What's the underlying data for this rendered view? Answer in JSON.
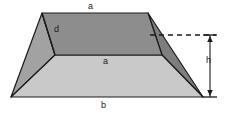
{
  "figure": {
    "width": 227,
    "height": 115,
    "background": "#ffffff",
    "stroke_color": "#1a1a1a",
    "stroke_width": 1.2,
    "faces": {
      "top": {
        "name": "top-face",
        "fill": "#8d8d8d",
        "points": "42,13 148,13 162,55 55,55"
      },
      "front": {
        "name": "front-face",
        "fill": "#c9c9c9",
        "points": "55,55 162,55 203,97 11,97"
      },
      "left": {
        "name": "left-face",
        "fill": "#a2a2a2",
        "points": "42,13 55,55 11,97"
      },
      "right": {
        "name": "right-face",
        "fill": "#7e7e7e",
        "points": "148,13 162,55 203,97"
      }
    },
    "dimension": {
      "dashed_line": {
        "x1": 150,
        "y1": 35,
        "x2": 216,
        "y2": 35,
        "dash": "5 4"
      },
      "height_line": {
        "x": 210,
        "y1": 35,
        "y2": 97
      },
      "tick_top": {
        "x1": 203,
        "y1": 35,
        "x2": 217,
        "y2": 35
      },
      "tick_bottom": {
        "x1": 203,
        "y1": 97,
        "x2": 217,
        "y2": 97
      }
    },
    "labels": {
      "a_top": "a",
      "d": "d",
      "a_mid": "a",
      "b": "b",
      "h": "h"
    }
  }
}
